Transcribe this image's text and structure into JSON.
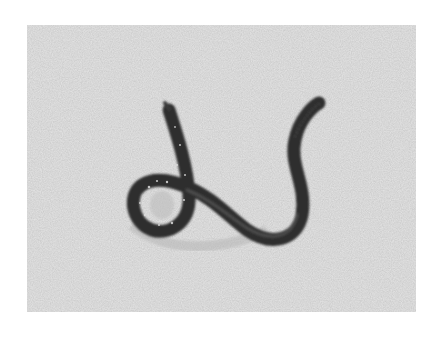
{
  "image": {
    "subject": "worm on sand",
    "colors": {
      "border": "#ffffff",
      "sand": "#c9c9c9",
      "sand_dark": "#a8a8a8",
      "worm": "#2e2e2e",
      "worm_highlight": "#5a5a5a"
    }
  }
}
